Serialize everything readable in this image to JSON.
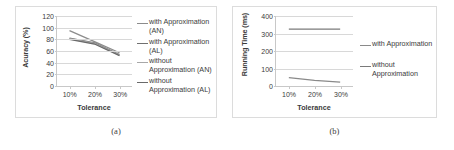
{
  "figure": {
    "panels": [
      {
        "caption": "(a)",
        "chart_data": {
          "type": "line",
          "title": "",
          "xlabel": "Tolerance",
          "ylabel": "Acuracy (%)",
          "categories": [
            "10%",
            "20%",
            "30%"
          ],
          "x": [
            10,
            20,
            30
          ],
          "xlim": [
            5,
            35
          ],
          "ylim": [
            0,
            120
          ],
          "yticks": [
            0,
            20,
            40,
            60,
            80,
            100,
            120
          ],
          "ytick_labels": [
            "0",
            "20",
            "40",
            "60",
            "80",
            "100",
            "120"
          ],
          "grid": true,
          "legend_position": "right",
          "series": [
            {
              "name": "with Approximation (AN)",
              "values": [
                95,
                76,
                57
              ],
              "color": "#8c8c8c"
            },
            {
              "name": "with Approximation (AL)",
              "values": [
                82,
                74,
                54
              ],
              "color": "#707070"
            },
            {
              "name": "without Approximation (AN)",
              "values": [
                81,
                73,
                53
              ],
              "color": "#a8a8a8"
            },
            {
              "name": "without Approximation (AL)",
              "values": [
                80,
                72,
                52
              ],
              "color": "#6a6a6a"
            }
          ]
        }
      },
      {
        "caption": "(b)",
        "chart_data": {
          "type": "line",
          "title": "",
          "xlabel": "Tolerance",
          "ylabel": "Running Time (ms)",
          "categories": [
            "10%",
            "20%",
            "30%"
          ],
          "x": [
            10,
            20,
            30
          ],
          "xlim": [
            5,
            35
          ],
          "ylim": [
            0,
            400
          ],
          "yticks": [
            0,
            100,
            200,
            300,
            400
          ],
          "ytick_labels": [
            "0",
            "100",
            "200",
            "300",
            "400"
          ],
          "grid": true,
          "legend_position": "right",
          "series": [
            {
              "name": "with Approximation",
              "values": [
                48,
                32,
                22
              ],
              "color": "#8a8a8a"
            },
            {
              "name": "without Approximation",
              "values": [
                325,
                325,
                325
              ],
              "color": "#7a7a7a"
            }
          ]
        }
      }
    ]
  }
}
